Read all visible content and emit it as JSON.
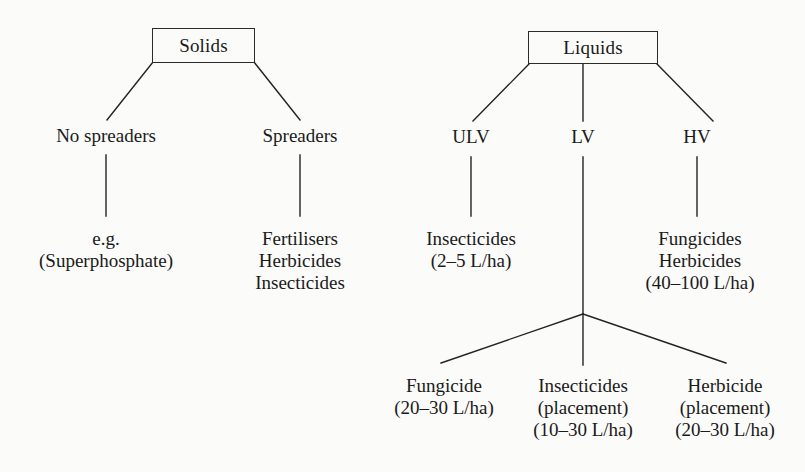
{
  "diagram": {
    "type": "tree-diagram",
    "ink_color": "#1a1a1a",
    "background_color": "#fbfbf9",
    "trees": [
      {
        "id": "solids",
        "root": {
          "label": "Solids"
        },
        "children": [
          {
            "id": "no-spreaders",
            "label": "No spreaders",
            "leaf_lines": [
              "e.g.",
              "(Superphosphate)"
            ]
          },
          {
            "id": "spreaders",
            "label": "Spreaders",
            "leaf_lines": [
              "Fertilisers",
              "Herbicides",
              "Insecticides"
            ]
          }
        ]
      },
      {
        "id": "liquids",
        "root": {
          "label": "Liquids"
        },
        "children": [
          {
            "id": "ulv",
            "label": "ULV",
            "leaf_lines": [
              "Insecticides",
              "(2–5 L/ha)"
            ]
          },
          {
            "id": "lv",
            "label": "LV",
            "leaf_lines": [],
            "sub_children": [
              {
                "id": "lv-fungicide",
                "leaf_lines": [
                  "Fungicide",
                  "(20–30 L/ha)"
                ]
              },
              {
                "id": "lv-insecticides",
                "leaf_lines": [
                  "Insecticides",
                  "(placement)",
                  "(10–30 L/ha)"
                ]
              },
              {
                "id": "lv-herbicide",
                "leaf_lines": [
                  "Herbicide",
                  "(placement)",
                  "(20–30 L/ha)"
                ]
              }
            ]
          },
          {
            "id": "hv",
            "label": "HV",
            "leaf_lines": [
              "Fungicides",
              "Herbicides",
              "(40–100 L/ha)"
            ]
          }
        ]
      }
    ]
  }
}
